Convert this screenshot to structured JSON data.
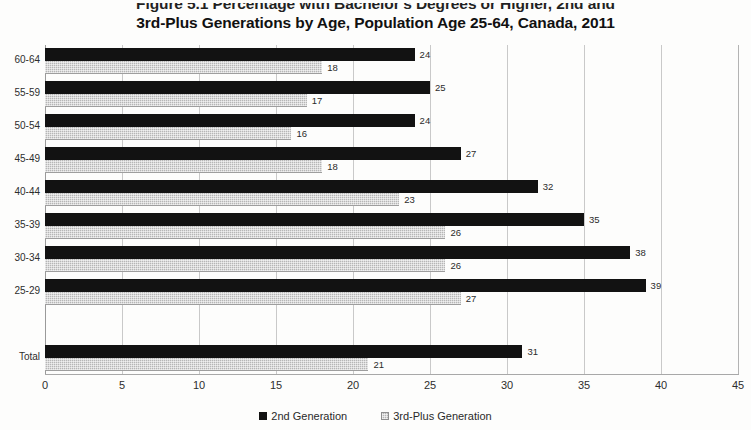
{
  "title": {
    "line1": "Figure 5.1  Percentage with Bachelor's Degrees or Higher, 2nd and",
    "line2": "3rd-Plus Generations by Age, Population Age 25-64, Canada, 2011"
  },
  "legend": {
    "items": [
      {
        "label": "2nd Generation",
        "marker": "filled-square-black",
        "color": "#121212"
      },
      {
        "label": "3rd-Plus Generation",
        "marker": "hatched-square-gray",
        "color": "#b6b6b6"
      }
    ],
    "position": "bottom-center"
  },
  "chart_data": {
    "type": "bar",
    "orientation": "horizontal",
    "title": "Figure 5.1  Percentage with Bachelor's Degrees or Higher, 2nd and 3rd-Plus Generations by Age, Population Age 25-64, Canada, 2011",
    "xlabel": "",
    "ylabel": "",
    "xlim": [
      0,
      45
    ],
    "xticks": [
      0,
      5,
      10,
      15,
      20,
      25,
      30,
      35,
      40,
      45
    ],
    "grid": "vertical",
    "categories": [
      "60-64",
      "55-59",
      "50-54",
      "45-49",
      "40-44",
      "35-39",
      "30-34",
      "25-29",
      "",
      "Total"
    ],
    "series": [
      {
        "name": "2nd Generation",
        "color": "#121212",
        "values": [
          24,
          25,
          24,
          27,
          32,
          35,
          38,
          39,
          null,
          31
        ]
      },
      {
        "name": "3rd-Plus Generation",
        "color": "#b6b6b6",
        "values": [
          18,
          17,
          16,
          18,
          23,
          26,
          26,
          27,
          null,
          21
        ]
      }
    ],
    "data_labels": true
  }
}
